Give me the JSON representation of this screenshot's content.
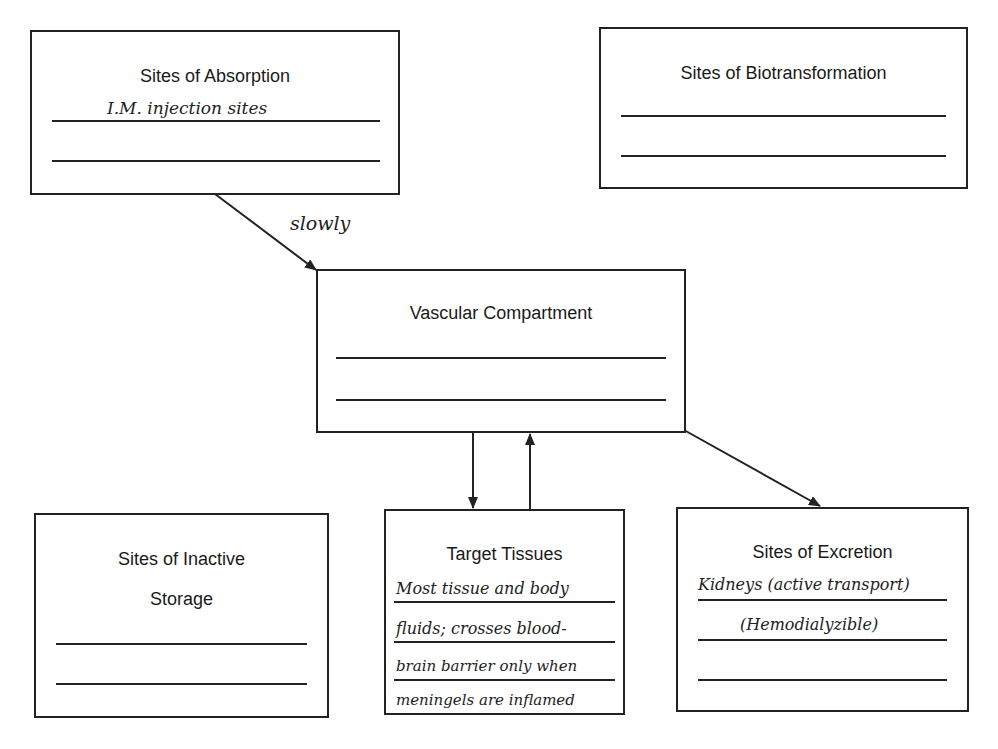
{
  "diagram": {
    "boxes": {
      "absorption": {
        "title": "Sites of Absorption",
        "entries": [
          "I.M. injection sites",
          ""
        ]
      },
      "biotransformation": {
        "title": "Sites of Biotransformation",
        "entries": [
          "",
          ""
        ]
      },
      "vascular": {
        "title": "Vascular Compartment",
        "entries": [
          "",
          ""
        ]
      },
      "inactive_storage": {
        "title_line1": "Sites of Inactive",
        "title_line2": "Storage",
        "entries": [
          "",
          ""
        ]
      },
      "target_tissues": {
        "title": "Target Tissues",
        "entries": [
          "Most tissue and body",
          "fluids; crosses blood-",
          "brain barrier only when",
          "meningels are inflamed"
        ]
      },
      "excretion": {
        "title": "Sites of Excretion",
        "entries": [
          "Kidneys (active transport)",
          "(Hemodialyzible)",
          ""
        ]
      }
    },
    "arrows": [
      {
        "from": "absorption",
        "to": "vascular",
        "label": "slowly"
      },
      {
        "from": "vascular",
        "to": "target_tissues",
        "label": ""
      },
      {
        "from": "target_tissues",
        "to": "vascular",
        "label": ""
      },
      {
        "from": "vascular",
        "to": "excretion",
        "label": ""
      }
    ]
  }
}
